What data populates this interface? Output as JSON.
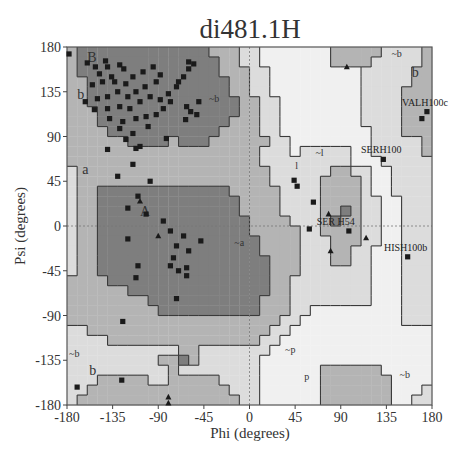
{
  "chart_data": {
    "type": "scatter",
    "title": "di481.1H",
    "xlabel": "Phi (degrees)",
    "ylabel": "Psi (degrees)",
    "xlim": [
      -180,
      180
    ],
    "ylim": [
      -180,
      180
    ],
    "xticks": [
      -180,
      -135,
      -90,
      -45,
      0,
      45,
      90,
      135,
      180
    ],
    "yticks": [
      180,
      135,
      90,
      45,
      0,
      -45,
      -90,
      -135,
      -180
    ],
    "grid": false,
    "reference_lines": {
      "phi": 0,
      "psi": 0,
      "style": "dotted"
    },
    "region_labels": [
      {
        "text": "B",
        "phi": -160,
        "psi": 165
      },
      {
        "text": "b",
        "phi": -170,
        "psi": 128
      },
      {
        "text": "~b",
        "phi": -40,
        "psi": 125
      },
      {
        "text": "a",
        "phi": -165,
        "psi": 52
      },
      {
        "text": "A",
        "phi": -108,
        "psi": 10
      },
      {
        "text": "~a",
        "phi": -15,
        "psi": -20
      },
      {
        "text": "~l",
        "phi": 65,
        "psi": 70
      },
      {
        "text": "l",
        "phi": 45,
        "psi": 57
      },
      {
        "text": "~b",
        "phi": 140,
        "psi": 170
      },
      {
        "text": "b",
        "phi": 160,
        "psi": 150
      },
      {
        "text": "~b",
        "phi": -178,
        "psi": -132
      },
      {
        "text": "b",
        "phi": -158,
        "psi": -150
      },
      {
        "text": "~p",
        "phi": 35,
        "psi": -128
      },
      {
        "text": "p",
        "phi": 54,
        "psi": -155
      },
      {
        "text": "~b",
        "phi": 148,
        "psi": -153
      }
    ],
    "labeled_points": [
      {
        "label": "VALH100c",
        "phi": 175,
        "psi": 115,
        "marker": "square"
      },
      {
        "label": "SERH100",
        "phi": 132,
        "psi": 67,
        "marker": "square"
      },
      {
        "label": "SER H54",
        "phi": 87,
        "psi": -5,
        "marker": "square"
      },
      {
        "label": "HISH100b",
        "phi": 156,
        "psi": -31,
        "marker": "square"
      }
    ],
    "series": [
      {
        "name": "residues (non-Gly)",
        "marker": "square",
        "points": [
          [
            -178,
            173
          ],
          [
            -160,
            164
          ],
          [
            -152,
            160
          ],
          [
            -142,
            166
          ],
          [
            -140,
            160
          ],
          [
            -128,
            162
          ],
          [
            -124,
            158
          ],
          [
            -136,
            150
          ],
          [
            -148,
            153
          ],
          [
            -155,
            142
          ],
          [
            -145,
            145
          ],
          [
            -133,
            145
          ],
          [
            -122,
            143
          ],
          [
            -115,
            150
          ],
          [
            -105,
            155
          ],
          [
            -95,
            160
          ],
          [
            -88,
            152
          ],
          [
            -92,
            145
          ],
          [
            -103,
            140
          ],
          [
            -112,
            135
          ],
          [
            -120,
            130
          ],
          [
            -130,
            135
          ],
          [
            -140,
            130
          ],
          [
            -150,
            128
          ],
          [
            -162,
            125
          ],
          [
            -153,
            117
          ],
          [
            -140,
            118
          ],
          [
            -128,
            120
          ],
          [
            -118,
            118
          ],
          [
            -108,
            125
          ],
          [
            -98,
            130
          ],
          [
            -88,
            127
          ],
          [
            -80,
            133
          ],
          [
            -72,
            140
          ],
          [
            -65,
            150
          ],
          [
            -60,
            158
          ],
          [
            -55,
            163
          ],
          [
            -60,
            165
          ],
          [
            -70,
            145
          ],
          [
            -78,
            125
          ],
          [
            -85,
            118
          ],
          [
            -92,
            112
          ],
          [
            -102,
            110
          ],
          [
            -112,
            108
          ],
          [
            -125,
            105
          ],
          [
            -138,
            108
          ],
          [
            -128,
            98
          ],
          [
            -115,
            93
          ],
          [
            -100,
            100
          ],
          [
            -108,
            80
          ],
          [
            -112,
            78
          ],
          [
            -58,
            115
          ],
          [
            -62,
            120
          ],
          [
            -50,
            125
          ],
          [
            -52,
            112
          ],
          [
            -63,
            107
          ],
          [
            -82,
            88
          ],
          [
            -122,
            87
          ],
          [
            -140,
            77
          ],
          [
            -115,
            62
          ],
          [
            -130,
            50
          ],
          [
            -98,
            45
          ],
          [
            -110,
            30
          ],
          [
            -120,
            18
          ],
          [
            -102,
            12
          ],
          [
            -85,
            5
          ],
          [
            -78,
            -5
          ],
          [
            -65,
            -10
          ],
          [
            -72,
            -20
          ],
          [
            -60,
            -25
          ],
          [
            -75,
            -32
          ],
          [
            -78,
            -40
          ],
          [
            -70,
            -45
          ],
          [
            -62,
            -42
          ],
          [
            -62,
            -50
          ],
          [
            -48,
            -15
          ],
          [
            -120,
            -13
          ],
          [
            -110,
            -40
          ],
          [
            -112,
            -52
          ],
          [
            -72,
            -73
          ],
          [
            -125,
            -96
          ],
          [
            -126,
            -155
          ],
          [
            -170,
            -162
          ],
          [
            44,
            46
          ],
          [
            47,
            40
          ],
          [
            63,
            24
          ],
          [
            59,
            -3
          ],
          [
            98,
            -5
          ],
          [
            132,
            67
          ],
          [
            175,
            115
          ],
          [
            156,
            -31
          ],
          [
            170,
            108
          ]
        ]
      },
      {
        "name": "glycine",
        "marker": "triangle",
        "points": [
          [
            -90,
            -10
          ],
          [
            -80,
            -172
          ],
          [
            -80,
            -178
          ],
          [
            96,
            160
          ],
          [
            78,
            12
          ],
          [
            115,
            -12
          ],
          [
            80,
            -25
          ],
          [
            -108,
            25
          ]
        ]
      }
    ]
  }
}
